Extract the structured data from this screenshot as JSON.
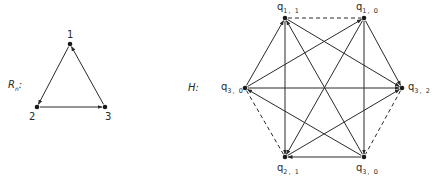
{
  "left_graph": {
    "label": "R",
    "label_sub": "n",
    "label_suffix": ":",
    "nodes": [
      {
        "id": "1",
        "label": "1",
        "x": 70,
        "y": 44
      },
      {
        "id": "2",
        "label": "2",
        "x": 37,
        "y": 107
      },
      {
        "id": "3",
        "label": "3",
        "x": 105,
        "y": 107
      }
    ],
    "edges": [
      {
        "from": "1",
        "to": "2",
        "style": "solid",
        "arrow": "to"
      },
      {
        "from": "2",
        "to": "3",
        "style": "solid",
        "arrow": "to"
      },
      {
        "from": "3",
        "to": "1",
        "style": "solid",
        "arrow": "to"
      }
    ]
  },
  "right_graph": {
    "label": "H",
    "label_suffix": ":",
    "nodes": [
      {
        "id": "q11",
        "label": "q",
        "sub": "1, 1",
        "x": 285,
        "y": 18
      },
      {
        "id": "q10",
        "label": "q",
        "sub": "1, 0",
        "x": 364,
        "y": 18
      },
      {
        "id": "q32",
        "label": "q",
        "sub": "3, 2",
        "x": 402,
        "y": 88
      },
      {
        "id": "q30b",
        "label": "q",
        "sub": "3, 0",
        "x": 364,
        "y": 157
      },
      {
        "id": "q21",
        "label": "q",
        "sub": "2, 1",
        "x": 285,
        "y": 157
      },
      {
        "id": "q30",
        "label": "q",
        "sub": "3, 0",
        "x": 245,
        "y": 88
      }
    ],
    "dashed_edges": [
      [
        "q11",
        "q10"
      ],
      [
        "q32",
        "q30b"
      ],
      [
        "q21",
        "q30"
      ]
    ],
    "solid_edges": [
      [
        "q30",
        "q11"
      ],
      [
        "q30",
        "q10"
      ],
      [
        "q30",
        "q32"
      ],
      [
        "q30b",
        "q30"
      ],
      [
        "q11",
        "q32"
      ],
      [
        "q11",
        "q21"
      ],
      [
        "q30b",
        "q11"
      ],
      [
        "q10",
        "q21"
      ],
      [
        "q10",
        "q30b"
      ],
      [
        "q10",
        "q32"
      ],
      [
        "q21",
        "q32"
      ],
      [
        "q30b",
        "q21"
      ]
    ]
  }
}
